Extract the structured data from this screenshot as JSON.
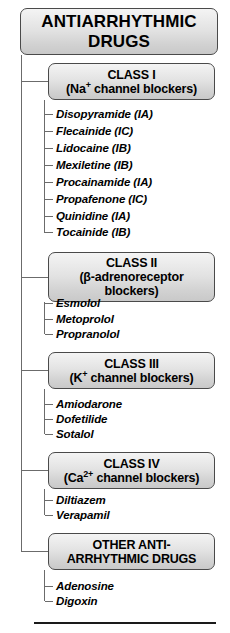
{
  "title": {
    "line1": "ANTIARRHYTHMIC",
    "line2": "DRUGS"
  },
  "classes": [
    {
      "id": "class1",
      "heading": "CLASS I",
      "subheading_prefix": "(Na",
      "subheading_sup": "+",
      "subheading_suffix": " channel blockers)",
      "drugs": [
        "Disopyramide (IA)",
        "Flecainide (IC)",
        "Lidocaine (IB)",
        "Mexiletine (IB)",
        "Procainamide (IA)",
        "Propafenone (IC)",
        "Quinidine (IA)",
        "Tocainide (IB)"
      ]
    },
    {
      "id": "class2",
      "heading": "CLASS II",
      "subheading_prefix": "(β-adrenoreceptor",
      "subheading_sup": "",
      "subheading_suffix": "blockers)",
      "drugs": [
        "Esmolol",
        "Metoprolol",
        "Propranolol"
      ]
    },
    {
      "id": "class3",
      "heading": "CLASS III",
      "subheading_prefix": "(K",
      "subheading_sup": "+",
      "subheading_suffix": " channel blockers)",
      "drugs": [
        "Amiodarone",
        "Dofetilide",
        "Sotalol"
      ]
    },
    {
      "id": "class4",
      "heading": "CLASS IV",
      "subheading_prefix": "(Ca",
      "subheading_sup": "2+",
      "subheading_suffix": " channel blockers)",
      "drugs": [
        "Diltiazem",
        "Verapamil"
      ]
    },
    {
      "id": "other",
      "heading": "OTHER ANTI-",
      "subheading_prefix": "ARRHYTHMIC DRUGS",
      "subheading_sup": "",
      "subheading_suffix": "",
      "drugs": [
        "Adenosine",
        "Digoxin"
      ]
    }
  ],
  "colors": {
    "box_border": "#4a4a4a",
    "box_fill_top": "#f4f4f4",
    "box_fill_bottom": "#c9c9c9",
    "line": "#6b6b6b",
    "rule": "#1a1a1a",
    "text": "#000000"
  }
}
